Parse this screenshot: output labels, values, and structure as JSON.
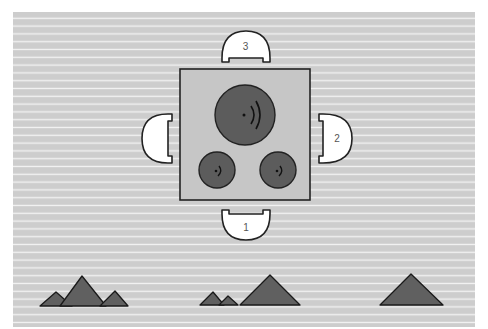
{
  "diagram": {
    "colors": {
      "background": "#cdcdcd",
      "stripe": "#f2f2f2",
      "table_fill": "#c6c6c6",
      "outline": "#222222",
      "burner": "#5c5c5c",
      "chair": "#ffffff",
      "mountain": "#606060"
    },
    "table": {
      "label": "table"
    },
    "burners": [
      {
        "id": "large-burner",
        "cx": 245,
        "cy": 115,
        "r": 30
      },
      {
        "id": "small-burner-left",
        "cx": 217,
        "cy": 170,
        "r": 18
      },
      {
        "id": "small-burner-right",
        "cx": 278,
        "cy": 170,
        "r": 18
      }
    ],
    "seats": [
      {
        "number": "1",
        "position": "bottom"
      },
      {
        "number": "2",
        "position": "right"
      },
      {
        "number": "3",
        "position": "top"
      },
      {
        "number": "",
        "position": "left"
      }
    ],
    "mountain_groups": [
      {
        "id": "group-left",
        "peaks": 3
      },
      {
        "id": "group-middle",
        "peaks": 3
      },
      {
        "id": "group-right",
        "peaks": 1
      }
    ]
  }
}
